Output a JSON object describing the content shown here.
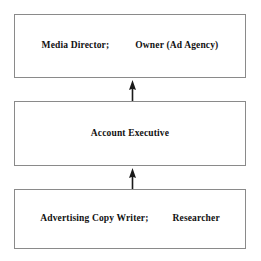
{
  "diagram": {
    "type": "organizational-hierarchy-flow",
    "orientation": "bottom-up",
    "background_color": "#ffffff",
    "border_color": "#8a8a8a",
    "text_color": "#111111",
    "nodes": [
      {
        "id": "top",
        "level": 3,
        "segments": [
          {
            "text": "Media Director;"
          },
          {
            "text": "Owner (Ad Agency)"
          }
        ]
      },
      {
        "id": "middle",
        "level": 2,
        "segments": [
          {
            "text": "Account Executive"
          }
        ]
      },
      {
        "id": "bottom",
        "level": 1,
        "segments": [
          {
            "text": "Advertising Copy Writer;"
          },
          {
            "text": "Researcher"
          }
        ]
      }
    ],
    "connectors": [
      {
        "id": "bottom-to-middle",
        "from": "bottom",
        "to": "middle",
        "style": "solid-line-filled-arrowhead",
        "direction": "up"
      },
      {
        "id": "middle-to-top",
        "from": "middle",
        "to": "top",
        "style": "solid-line-filled-arrowhead",
        "direction": "up"
      }
    ]
  }
}
